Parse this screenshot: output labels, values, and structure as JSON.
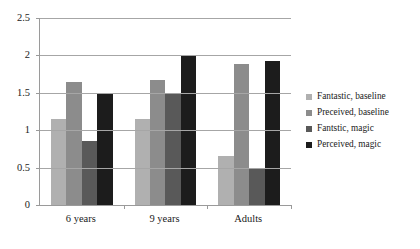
{
  "chart_data": {
    "type": "bar",
    "title": "",
    "xlabel": "",
    "ylabel": "",
    "ylim": [
      0,
      2.5
    ],
    "yticks": [
      "0",
      "0.5",
      "1",
      "1.5",
      "2",
      "2.5"
    ],
    "ytick_values": [
      0,
      0.5,
      1,
      1.5,
      2,
      2.5
    ],
    "grid": true,
    "legend_position": "right",
    "categories": [
      "6 years",
      "9 years",
      "Adults"
    ],
    "series": [
      {
        "name": "Fantastic, baseline",
        "color": "#b0b0b0",
        "values": [
          1.15,
          1.15,
          0.65
        ]
      },
      {
        "name": "Preceived, baseline",
        "color": "#8c8c8c",
        "values": [
          1.65,
          1.67,
          1.88
        ]
      },
      {
        "name": "Fantstic, magic",
        "color": "#595959",
        "values": [
          0.85,
          1.5,
          0.48
        ]
      },
      {
        "name": "Perceived, magic",
        "color": "#1c1c1c",
        "values": [
          1.5,
          2.0,
          1.93
        ]
      }
    ]
  },
  "axis": {
    "line_color": "#9a9a9a",
    "grid_color": "#a6a6a6"
  },
  "legend": {
    "items": [
      {
        "label": "Fantastic, baseline"
      },
      {
        "label": "Preceived, baseline"
      },
      {
        "label": "Fantstic, magic"
      },
      {
        "label": "Perceived, magic"
      }
    ]
  }
}
